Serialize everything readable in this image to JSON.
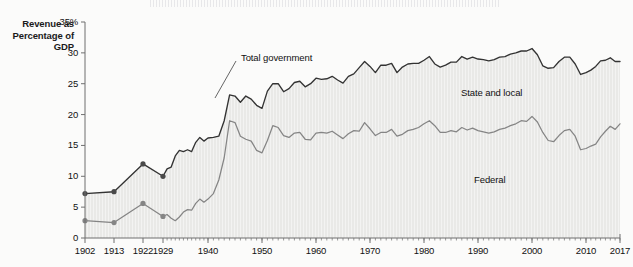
{
  "axis_title": "Revenue as Percentage of GDP",
  "top_strip_note": "",
  "annotations": {
    "total": "Total government",
    "state_local": "State and local",
    "federal": "Federal"
  },
  "colors": {
    "total_line": "#333333",
    "federal_line": "#858585",
    "fill": "#e9e9e7",
    "background": "#fbfbfa",
    "axis": "#6f6f6f",
    "marker": "#4a4a4a"
  },
  "chart_data": {
    "type": "area",
    "title": "Revenue as Percentage of GDP",
    "xlabel": "",
    "ylabel": "Revenue as Percentage of GDP",
    "ylim": [
      0,
      35
    ],
    "yticks": [
      0,
      5,
      10,
      15,
      20,
      25,
      30,
      35
    ],
    "ytick_labels": [
      "0",
      "5",
      "10",
      "15",
      "20",
      "25",
      "30",
      "35%"
    ],
    "xlim": [
      1902,
      2017
    ],
    "xtick_labels": [
      "1902",
      "1913",
      "1922",
      "1929",
      "1940",
      "1950",
      "1960",
      "1970",
      "1980",
      "1990",
      "2000",
      "2010",
      "2017"
    ],
    "xtick_values": [
      1902,
      1913,
      1922,
      1929,
      1940,
      1950,
      1960,
      1970,
      1980,
      1990,
      2000,
      2010,
      2017
    ],
    "grid": false,
    "legend_position": "inline-annotations",
    "marker_years": [
      1902,
      1913,
      1922,
      1929
    ],
    "series": [
      {
        "name": "Total government",
        "x": [
          1902,
          1913,
          1922,
          1929,
          1930,
          1931,
          1932,
          1933,
          1934,
          1935,
          1936,
          1937,
          1938,
          1939,
          1940,
          1941,
          1942,
          1943,
          1944,
          1945,
          1946,
          1947,
          1948,
          1949,
          1950,
          1951,
          1952,
          1953,
          1954,
          1955,
          1956,
          1957,
          1958,
          1959,
          1960,
          1961,
          1962,
          1963,
          1964,
          1965,
          1966,
          1967,
          1968,
          1969,
          1970,
          1971,
          1972,
          1973,
          1974,
          1975,
          1976,
          1977,
          1978,
          1979,
          1980,
          1981,
          1982,
          1983,
          1984,
          1985,
          1986,
          1987,
          1988,
          1989,
          1990,
          1991,
          1992,
          1993,
          1994,
          1995,
          1996,
          1997,
          1998,
          1999,
          2000,
          2001,
          2002,
          2003,
          2004,
          2005,
          2006,
          2007,
          2008,
          2009,
          2010,
          2011,
          2012,
          2013,
          2014,
          2015,
          2016,
          2017
        ],
        "values": [
          7.2,
          7.5,
          12.0,
          10.0,
          11.2,
          11.5,
          13.3,
          14.2,
          14.0,
          14.3,
          14.0,
          15.5,
          16.3,
          15.7,
          16.2,
          16.3,
          16.5,
          19.0,
          23.2,
          23.0,
          22.0,
          23.0,
          22.5,
          21.5,
          21.0,
          23.8,
          25.0,
          25.0,
          23.7,
          24.2,
          25.2,
          25.4,
          24.5,
          25.0,
          25.9,
          25.7,
          25.8,
          26.2,
          25.6,
          25.1,
          26.2,
          26.6,
          27.6,
          28.6,
          27.8,
          26.8,
          28.0,
          28.0,
          28.3,
          26.8,
          27.7,
          28.2,
          28.3,
          28.3,
          28.8,
          29.4,
          28.2,
          27.7,
          28.0,
          28.5,
          28.5,
          29.4,
          29.0,
          29.3,
          29.0,
          28.9,
          28.7,
          28.9,
          29.3,
          29.4,
          29.8,
          30.0,
          30.3,
          30.3,
          30.7,
          29.7,
          27.9,
          27.5,
          27.6,
          28.6,
          29.3,
          29.3,
          28.2,
          26.5,
          26.8,
          27.2,
          27.8,
          28.7,
          28.8,
          29.2,
          28.6,
          28.6
        ]
      },
      {
        "name": "Federal",
        "x": [
          1902,
          1913,
          1922,
          1929,
          1930,
          1931,
          1932,
          1933,
          1934,
          1935,
          1936,
          1937,
          1938,
          1939,
          1940,
          1941,
          1942,
          1943,
          1944,
          1945,
          1946,
          1947,
          1948,
          1949,
          1950,
          1951,
          1952,
          1953,
          1954,
          1955,
          1956,
          1957,
          1958,
          1959,
          1960,
          1961,
          1962,
          1963,
          1964,
          1965,
          1966,
          1967,
          1968,
          1969,
          1970,
          1971,
          1972,
          1973,
          1974,
          1975,
          1976,
          1977,
          1978,
          1979,
          1980,
          1981,
          1982,
          1983,
          1984,
          1985,
          1986,
          1987,
          1988,
          1989,
          1990,
          1991,
          1992,
          1993,
          1994,
          1995,
          1996,
          1997,
          1998,
          1999,
          2000,
          2001,
          2002,
          2003,
          2004,
          2005,
          2006,
          2007,
          2008,
          2009,
          2010,
          2011,
          2012,
          2013,
          2014,
          2015,
          2016,
          2017
        ],
        "values": [
          2.8,
          2.5,
          5.6,
          3.5,
          3.8,
          3.2,
          2.8,
          3.4,
          4.2,
          4.6,
          4.5,
          5.6,
          6.3,
          5.8,
          6.3,
          7.2,
          9.4,
          13.0,
          19.0,
          18.7,
          16.5,
          16.0,
          15.7,
          14.2,
          13.8,
          15.8,
          18.2,
          17.9,
          16.6,
          16.3,
          17.0,
          17.1,
          16.0,
          15.9,
          17.0,
          17.1,
          17.0,
          17.3,
          16.7,
          16.1,
          16.9,
          17.4,
          17.3,
          18.7,
          17.7,
          16.6,
          17.1,
          17.1,
          17.6,
          16.5,
          16.8,
          17.4,
          17.6,
          17.9,
          18.5,
          19.0,
          18.2,
          17.1,
          17.1,
          17.4,
          17.2,
          17.9,
          17.5,
          17.8,
          17.4,
          17.2,
          17.0,
          17.2,
          17.6,
          17.8,
          18.2,
          18.5,
          19.0,
          18.9,
          19.7,
          18.8,
          17.1,
          15.8,
          15.6,
          16.6,
          17.4,
          17.6,
          16.5,
          14.3,
          14.5,
          14.9,
          15.2,
          16.4,
          17.3,
          18.1,
          17.6,
          18.5
        ]
      }
    ]
  }
}
